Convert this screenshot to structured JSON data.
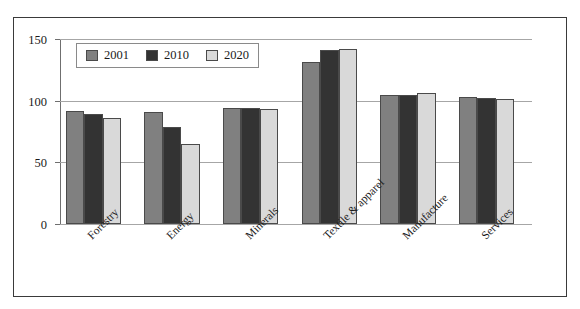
{
  "chart_data": {
    "type": "bar",
    "title": "",
    "subtitle": "",
    "xlabel": "",
    "ylabel": "",
    "ylim": [
      0,
      150
    ],
    "yticks": [
      0,
      50,
      100,
      150
    ],
    "ytick_labels": [
      "0",
      "50",
      "100",
      "150"
    ],
    "grid": true,
    "legend_position": "top-left inside plot",
    "categories": [
      "Forestry",
      "Energy",
      "Minerals",
      "Textile & apparel",
      "Manufacture",
      "Services"
    ],
    "series": [
      {
        "name": "2001",
        "color": "#808080",
        "values": [
          92,
          91,
          94,
          131,
          105,
          103
        ]
      },
      {
        "name": "2010",
        "color": "#333333",
        "values": [
          89,
          79,
          94,
          141,
          105,
          102
        ]
      },
      {
        "name": "2020",
        "color": "#d9d9d9",
        "values": [
          86,
          65,
          93,
          142,
          106,
          101
        ]
      }
    ]
  },
  "legend": {
    "entries": [
      {
        "label": "2001",
        "swatch": "legend-swatch-2001"
      },
      {
        "label": "2010",
        "swatch": "legend-swatch-2010"
      },
      {
        "label": "2020",
        "swatch": "legend-swatch-2020"
      }
    ]
  },
  "colors": {
    "series_2001": "#808080",
    "series_2010": "#333333",
    "series_2020": "#d9d9d9",
    "bar_outline": "#4a4a4a",
    "gridline": "#a6a6a6",
    "axis": "#6f6f6f",
    "frame_border": "#3a3a3a",
    "text": "#1a1a1a",
    "background": "#ffffff"
  }
}
